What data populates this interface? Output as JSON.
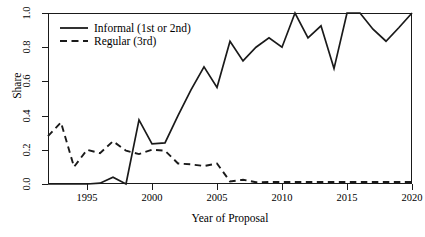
{
  "chart_data": {
    "type": "line",
    "title": "",
    "xlabel": "Year of Proposal",
    "ylabel": "Share",
    "xlim": [
      1992,
      2020
    ],
    "ylim": [
      0.0,
      1.0
    ],
    "grid": false,
    "legend_position": "top-left",
    "x": [
      1992,
      1993,
      1994,
      1995,
      1996,
      1997,
      1998,
      1999,
      2000,
      2001,
      2002,
      2003,
      2004,
      2005,
      2006,
      2007,
      2008,
      2009,
      2010,
      2011,
      2012,
      2013,
      2014,
      2015,
      2016,
      2017,
      2018,
      2019,
      2020
    ],
    "xticks": [
      1995,
      2000,
      2005,
      2010,
      2015,
      2020
    ],
    "xtick_labels": [
      "1995",
      "2000",
      "2005",
      "2010",
      "2015",
      "2020"
    ],
    "yticks": [
      0.0,
      0.2,
      0.4,
      0.6,
      0.8,
      1.0
    ],
    "ytick_labels": [
      "0.0",
      "0.2",
      "0.4",
      "0.6",
      "0.8",
      "1.0"
    ],
    "series": [
      {
        "name": "Informal (1st or 2nd)",
        "style": "solid",
        "color": "#1a1a1a",
        "values": [
          0.0,
          0.0,
          0.0,
          0.0,
          0.005,
          0.04,
          0.0,
          0.375,
          0.235,
          0.24,
          0.4,
          0.55,
          0.685,
          0.565,
          0.835,
          0.72,
          0.8,
          0.855,
          0.8,
          1.0,
          0.855,
          0.925,
          0.675,
          1.0,
          1.0,
          0.905,
          0.835,
          0.915,
          1.0
        ]
      },
      {
        "name": "Regular (3rd)",
        "style": "dashed",
        "color": "#1a1a1a",
        "values": [
          0.28,
          0.36,
          0.1,
          0.2,
          0.18,
          0.25,
          0.195,
          0.175,
          0.2,
          0.195,
          0.12,
          0.115,
          0.105,
          0.12,
          0.015,
          0.025,
          0.01,
          0.012,
          0.012,
          0.012,
          0.012,
          0.012,
          0.012,
          0.012,
          0.012,
          0.012,
          0.012,
          0.012,
          0.012
        ]
      }
    ]
  },
  "axes": {
    "y_title": "Share",
    "x_title": "Year of Proposal"
  },
  "legend": {
    "items": [
      {
        "label": "Informal (1st or 2nd)",
        "style": "solid"
      },
      {
        "label": "Regular (3rd)",
        "style": "dashed"
      }
    ]
  }
}
